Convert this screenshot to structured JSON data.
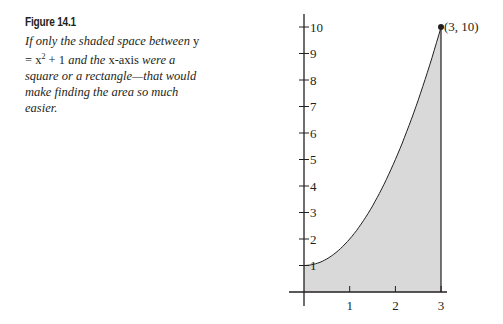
{
  "figure": {
    "title": "Figure 14.1",
    "caption_parts": [
      "If only the shaded space between ",
      "y = x",
      "2",
      " + 1",
      " and the ",
      "x-axis",
      " were a square or a rectangle—that would make finding the area so much easier."
    ]
  },
  "chart_data": {
    "type": "area",
    "title": "Figure 14.1",
    "function": "y = x^2 + 1",
    "x": [
      0,
      0.5,
      1,
      1.5,
      2,
      2.5,
      3
    ],
    "y": [
      1,
      1.25,
      2,
      3.25,
      5,
      7.25,
      10
    ],
    "shaded_region": {
      "from_x": 0,
      "to_x": 3,
      "between": "curve and x-axis"
    },
    "x_ticks": [
      "1",
      "2",
      "3"
    ],
    "y_ticks": [
      "1",
      "2",
      "3",
      "4",
      "5",
      "6",
      "7",
      "8",
      "9",
      "10"
    ],
    "xlim": [
      0,
      3
    ],
    "ylim": [
      0,
      10
    ],
    "annotations": [
      {
        "x": 3,
        "y": 10,
        "label": "(3, 10)"
      }
    ],
    "grid": false,
    "fill_color": "#d9d9d9",
    "line_color": "#231f20"
  }
}
